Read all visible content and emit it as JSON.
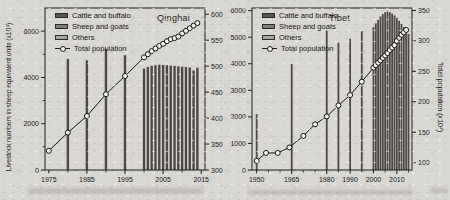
{
  "figure": {
    "colors": {
      "background": "#d9d7d2",
      "bar": "#4d4a46",
      "axis": "#1e1e1e",
      "line": "#141414",
      "marker_fill": "#f5f3ef",
      "text": "#1a1a1a",
      "legend_swatches": [
        "#565656",
        "#7f7f7f",
        "#a6a6a6"
      ]
    }
  },
  "chart_data": [
    {
      "type": "combo-bar-line",
      "title": "Qinghai",
      "ylabel_left": "Livestock numbers in sheep equivalent units (x10⁴)",
      "ylabel_right": "",
      "legend": [
        "Cattle and buffalo",
        "Sheep and goats",
        "Others",
        "Total population"
      ],
      "x_range": [
        1974,
        2016
      ],
      "yleft_range": [
        0,
        7000
      ],
      "yright_range": [
        300,
        612
      ],
      "x_ticks": [
        1975,
        1985,
        1995,
        2005,
        2015
      ],
      "x_minor": [
        1980,
        1990,
        2000,
        2010
      ],
      "yleft_ticks": [
        0,
        2000,
        4000,
        6000
      ],
      "yleft_minor": [
        1000,
        3000,
        5000
      ],
      "yright_ticks": [
        300,
        350,
        400,
        450,
        500,
        550,
        600
      ],
      "bar_width": 2.4,
      "bars": {
        "years": [
          1980,
          1985,
          1990,
          1995,
          2000,
          2001,
          2002,
          2003,
          2004,
          2005,
          2006,
          2007,
          2008,
          2009,
          2010,
          2011,
          2012,
          2013,
          2014
        ],
        "totals": [
          4800,
          4740,
          5230,
          4960,
          4380,
          4450,
          4500,
          4530,
          4550,
          4540,
          4530,
          4510,
          4500,
          4480,
          4460,
          4450,
          4430,
          4300,
          4420
        ]
      },
      "line": {
        "name": "Total population",
        "years": [
          1975,
          1980,
          1985,
          1990,
          1995,
          2000,
          2001,
          2002,
          2003,
          2004,
          2005,
          2006,
          2007,
          2008,
          2009,
          2010,
          2011,
          2012,
          2013,
          2014
        ],
        "values": [
          337,
          372,
          404,
          446,
          481,
          517,
          523,
          529,
          534,
          539,
          543,
          548,
          552,
          554,
          557,
          563,
          568,
          573,
          578,
          583
        ]
      }
    },
    {
      "type": "combo-bar-line",
      "title": "Tibet",
      "ylabel_left": "",
      "ylabel_right": "Total population (x10⁴)",
      "legend": [
        "Cattle and buffalo",
        "Sheep and goats",
        "Others",
        "Total population"
      ],
      "x_range": [
        1948,
        2016.5
      ],
      "yleft_range": [
        0,
        6100
      ],
      "yright_range": [
        88,
        354
      ],
      "x_ticks": [
        1950,
        1965,
        1980,
        1990,
        2000,
        2010
      ],
      "x_minor": [
        1955,
        1960,
        1970,
        1975,
        1985,
        1995,
        2005,
        2015
      ],
      "yleft_ticks": [
        0,
        1000,
        2000,
        3000,
        4000,
        5000,
        6000
      ],
      "yleft_minor": [],
      "yright_ticks": [
        100,
        150,
        200,
        250,
        300,
        350
      ],
      "bar_width": 1.8,
      "bars": {
        "years": [
          1950,
          1965,
          1980,
          1985,
          1990,
          1995,
          2000,
          2001,
          2002,
          2003,
          2004,
          2005,
          2006,
          2007,
          2008,
          2009,
          2010,
          2011,
          2012,
          2013,
          2014,
          2015
        ],
        "totals": [
          2100,
          3990,
          5250,
          4790,
          4940,
          5230,
          5380,
          5520,
          5650,
          5780,
          5870,
          5940,
          5970,
          5940,
          5890,
          5820,
          5730,
          5620,
          5500,
          5380,
          5250,
          5120
        ]
      },
      "line": {
        "name": "Total population",
        "years": [
          1950,
          1954,
          1959,
          1964,
          1970,
          1975,
          1980,
          1985,
          1990,
          1995,
          2000,
          2001,
          2002,
          2003,
          2004,
          2005,
          2006,
          2007,
          2008,
          2009,
          2010,
          2011,
          2012,
          2013,
          2014
        ],
        "values": [
          103,
          116,
          116,
          125,
          144,
          163,
          176,
          194,
          211,
          233,
          256,
          260,
          264,
          268,
          272,
          276,
          280,
          285,
          289,
          293,
          300,
          305,
          310,
          314,
          318
        ]
      }
    }
  ]
}
